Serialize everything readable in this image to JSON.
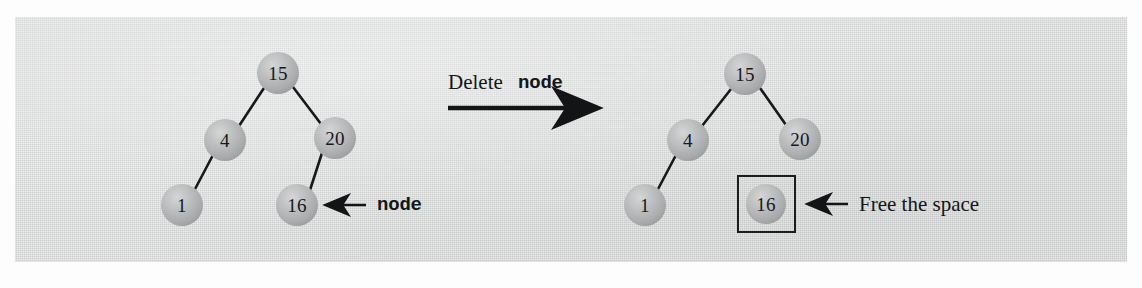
{
  "figure": {
    "kind": "binary-search-tree-deletion-diagram",
    "panel_color": "#d9dada",
    "ink_color": "#15171a",
    "node_fill": "#b9bbbc"
  },
  "transition": {
    "label_prefix": "Delete",
    "label_code": "node",
    "arrow_icon": "right-arrow-icon"
  },
  "before": {
    "caption_arrow_icon": "left-arrow-icon",
    "caption": "node",
    "nodes": [
      {
        "id": "n15",
        "value": "15",
        "cx": 278,
        "cy": 73
      },
      {
        "id": "n4",
        "value": "4",
        "cx": 225,
        "cy": 140
      },
      {
        "id": "n20",
        "value": "20",
        "cx": 335,
        "cy": 138
      },
      {
        "id": "n1",
        "value": "1",
        "cx": 182,
        "cy": 205
      },
      {
        "id": "n16",
        "value": "16",
        "cx": 297,
        "cy": 205
      }
    ],
    "edges": [
      {
        "from": "n15",
        "to": "n4"
      },
      {
        "from": "n15",
        "to": "n20"
      },
      {
        "from": "n4",
        "to": "n1"
      },
      {
        "from": "n20",
        "to": "n16"
      }
    ]
  },
  "after": {
    "caption_arrow_icon": "left-arrow-icon",
    "caption": "Free the space",
    "nodes": [
      {
        "id": "n15",
        "value": "15",
        "cx": 745,
        "cy": 74
      },
      {
        "id": "n4",
        "value": "4",
        "cx": 688,
        "cy": 140
      },
      {
        "id": "n20",
        "value": "20",
        "cx": 800,
        "cy": 139
      },
      {
        "id": "n1",
        "value": "1",
        "cx": 645,
        "cy": 205
      },
      {
        "id": "n16",
        "value": "16",
        "cx": 766,
        "cy": 204
      }
    ],
    "edges": [
      {
        "from": "n15",
        "to": "n4"
      },
      {
        "from": "n15",
        "to": "n20"
      },
      {
        "from": "n4",
        "to": "n1"
      }
    ],
    "freed_box": {
      "x": 737,
      "y": 175,
      "w": 59,
      "h": 58
    }
  }
}
